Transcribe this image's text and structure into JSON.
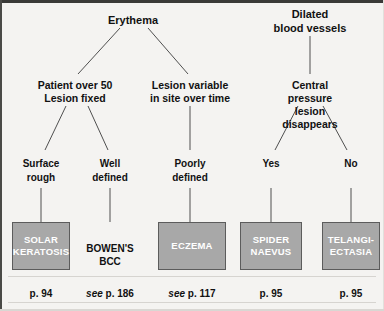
{
  "diagram": {
    "type": "decision-tree",
    "colors": {
      "background": "#f4f3f1",
      "box_fill": "#a8a8a8",
      "box_border": "#5c5c5c",
      "box_text": "#ffffff",
      "text": "#111111",
      "edge": "#4f4f4f",
      "frame": "#3a3a38"
    },
    "roots": [
      {
        "id": "erythema",
        "label": "Erythema",
        "x": 133,
        "y": 20
      },
      {
        "id": "dilated",
        "label": "Dilated\nblood vessels",
        "x": 310,
        "y": 14
      }
    ],
    "criteria": [
      {
        "id": "patient-over-50",
        "label": "Patient over 50\nLesion fixed",
        "x": 75,
        "y": 85
      },
      {
        "id": "lesion-variable",
        "label": "Lesion variable\nin site over time",
        "x": 190,
        "y": 85
      },
      {
        "id": "central-pressure",
        "label": "Central pressure\nlesion disappears",
        "x": 310,
        "y": 85
      }
    ],
    "branch_labels": [
      {
        "id": "surface-rough",
        "label": "Surface\nrough",
        "x": 41,
        "y": 160
      },
      {
        "id": "well-defined",
        "label": "Well\ndefined",
        "x": 110,
        "y": 160
      },
      {
        "id": "poorly-defined",
        "label": "Poorly\ndefined",
        "x": 190,
        "y": 160
      },
      {
        "id": "yes",
        "label": "Yes",
        "x": 271,
        "y": 160
      },
      {
        "id": "no",
        "label": "No",
        "x": 351,
        "y": 160
      }
    ],
    "diagnoses": [
      {
        "id": "solar-keratosis",
        "label": "SOLAR\nKERATOSIS",
        "boxed": true,
        "x": 41,
        "y": 222,
        "w": 58,
        "h": 48,
        "page": "p. 94",
        "page_prefix": ""
      },
      {
        "id": "bowens-bcc",
        "label": "BOWEN'S\nBCC",
        "boxed": false,
        "x": 110,
        "y": 228,
        "w": 58,
        "h": 48,
        "page": "p. 186",
        "page_prefix": "see "
      },
      {
        "id": "eczema",
        "label": "ECZEMA",
        "boxed": true,
        "x": 192,
        "y": 222,
        "w": 68,
        "h": 48,
        "page": "p. 117",
        "page_prefix": "see "
      },
      {
        "id": "spider-naevus",
        "label": "SPIDER\nNAEVUS",
        "boxed": true,
        "x": 271,
        "y": 222,
        "w": 62,
        "h": 48,
        "page": "p. 95",
        "page_prefix": ""
      },
      {
        "id": "telangiectasia",
        "label": "TELANGI-\nECTASIA",
        "boxed": true,
        "x": 351,
        "y": 222,
        "w": 58,
        "h": 48,
        "page": "p. 95",
        "page_prefix": ""
      }
    ],
    "page_refs_y": 288
  }
}
